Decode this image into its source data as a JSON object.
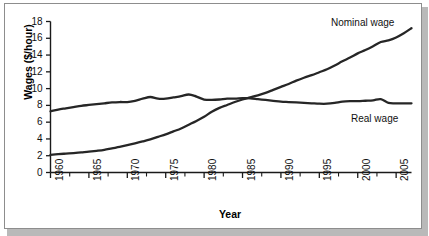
{
  "chart_data": {
    "type": "line",
    "title": "",
    "xlabel": "Year",
    "ylabel": "Wages ($/hour)",
    "xlim": [
      1960,
      2007
    ],
    "ylim": [
      0,
      18
    ],
    "ytick_step": 2,
    "xtick_step": 5,
    "xtick_minor_step": 1,
    "grid": false,
    "legend_position": "inline-annotations",
    "x": [
      1960,
      1961,
      1962,
      1963,
      1964,
      1965,
      1966,
      1967,
      1968,
      1969,
      1970,
      1971,
      1972,
      1973,
      1974,
      1975,
      1976,
      1977,
      1978,
      1979,
      1980,
      1981,
      1982,
      1983,
      1984,
      1985,
      1986,
      1987,
      1988,
      1989,
      1990,
      1991,
      1992,
      1993,
      1994,
      1995,
      1996,
      1997,
      1998,
      1999,
      2000,
      2001,
      2002,
      2003,
      2004,
      2005,
      2006,
      2007
    ],
    "series": [
      {
        "name": "Nominal wage",
        "color": "#262626",
        "values": [
          2.1,
          2.18,
          2.25,
          2.32,
          2.4,
          2.48,
          2.58,
          2.7,
          2.88,
          3.05,
          3.25,
          3.47,
          3.7,
          3.95,
          4.25,
          4.55,
          4.9,
          5.25,
          5.7,
          6.15,
          6.65,
          7.25,
          7.7,
          8.05,
          8.4,
          8.7,
          8.95,
          9.2,
          9.5,
          9.85,
          10.2,
          10.55,
          10.95,
          11.3,
          11.6,
          11.95,
          12.3,
          12.75,
          13.25,
          13.7,
          14.2,
          14.6,
          15.05,
          15.55,
          15.75,
          16.1,
          16.6,
          17.2
        ]
      },
      {
        "name": "Real wage",
        "color": "#262626",
        "values": [
          7.3,
          7.5,
          7.65,
          7.8,
          7.95,
          8.05,
          8.15,
          8.25,
          8.35,
          8.4,
          8.4,
          8.55,
          8.8,
          9.0,
          8.8,
          8.8,
          8.95,
          9.1,
          9.3,
          9.05,
          8.7,
          8.65,
          8.7,
          8.8,
          8.8,
          8.85,
          8.85,
          8.75,
          8.65,
          8.55,
          8.45,
          8.4,
          8.35,
          8.3,
          8.25,
          8.2,
          8.2,
          8.3,
          8.45,
          8.5,
          8.5,
          8.55,
          8.6,
          8.75,
          8.3,
          8.25,
          8.25,
          8.25
        ]
      }
    ],
    "ytick_labels": [
      "18",
      "16",
      "14",
      "12",
      "10",
      "8",
      "6",
      "4",
      "2",
      "0"
    ],
    "ytick_values": [
      18,
      16,
      14,
      12,
      10,
      8,
      6,
      4,
      2,
      0
    ],
    "xtick_labels": [
      "1960",
      "1965",
      "1970",
      "1975",
      "1980",
      "1985",
      "1990",
      "1995",
      "2000",
      "2005"
    ],
    "xtick_values": [
      1960,
      1965,
      1970,
      1975,
      1980,
      1985,
      1990,
      1995,
      2000,
      2005
    ],
    "annotations": [
      {
        "name": "nominal-wage-label",
        "text": "Nominal wage"
      },
      {
        "name": "real-wage-label",
        "text": "Real wage"
      }
    ]
  },
  "colors": {
    "line": "#262626",
    "axis": "#1a1a1a",
    "frame_border": "#8d8d8d",
    "shadow": "#b9b9b9",
    "background": "#ffffff"
  }
}
